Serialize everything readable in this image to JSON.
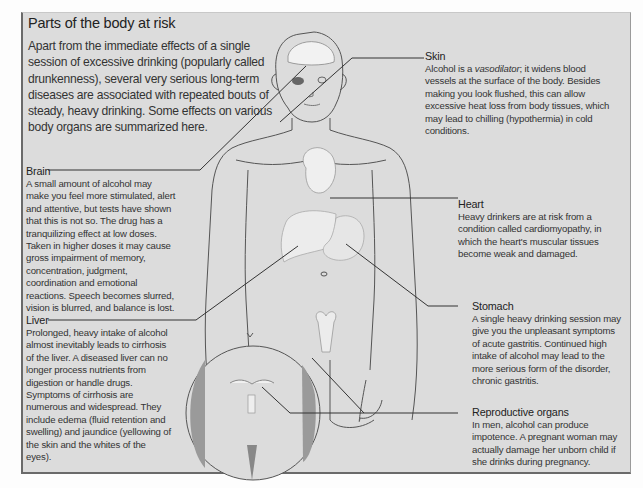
{
  "title": "Parts of the body at risk",
  "intro": "Apart from the immediate effects of a single session of excessive drinking (popularly called drunkenness), several very serious long-term diseases are associated with repeated bouts of steady, heavy drinking. Some effects on various body organs are summarized here.",
  "callouts": {
    "skin": {
      "heading": "Skin",
      "text_before": "Alcohol is a ",
      "italic": "vasodilator",
      "text_after": "; it widens blood vessels at the surface of the body. Besides making you look flushed, this can allow excessive heat loss from body tissues, which may lead to chilling (hypothermia) in cold conditions."
    },
    "brain": {
      "heading": "Brain",
      "text": "A small amount of alcohol may make you feel more stimulated, alert and attentive, but tests have shown that this is not so. The drug has a tranquilizing effect at low doses. Taken in higher doses it may cause gross impairment of memory, concentration, judgment, coordination and emotional reactions. Speech becomes slurred, vision is blurred, and balance is lost."
    },
    "heart": {
      "heading": "Heart",
      "text": "Heavy drinkers are at risk from a condition called cardiomyopathy, in which the heart's muscular tissues become weak and damaged."
    },
    "stomach": {
      "heading": "Stomach",
      "text": "A single heavy drinking session may give you the unpleasant symptoms of acute gastritis. Continued high intake of alcohol may lead to the more serious form of the disorder, chronic gastritis."
    },
    "liver": {
      "heading": "Liver",
      "text": "Prolonged, heavy intake of alcohol almost inevitably leads to cirrhosis of the liver. A diseased liver can no longer process nutrients from digestion or handle drugs. Symptoms of cirrhosis are numerous and widespread. They include edema (fluid retention and swelling) and jaundice (yellowing of the skin and the whites of the eyes)."
    },
    "reproductive": {
      "heading": "Reproductive organs",
      "text": "In men, alcohol can produce impotence. A pregnant woman may actually damage her unborn child if she drinks during pregnancy."
    }
  },
  "colors": {
    "panel": "#dcdcdc",
    "border": "#6a6a6a",
    "text": "#333333",
    "line": "#3a3a3a"
  }
}
